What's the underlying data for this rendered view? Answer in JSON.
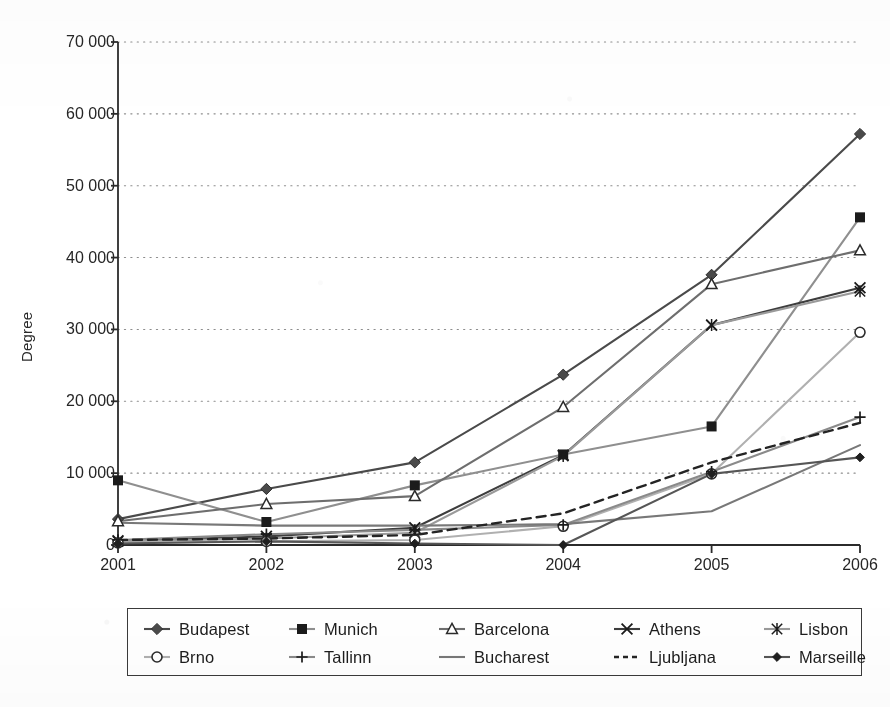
{
  "chart_data": {
    "type": "line",
    "title": "",
    "xlabel": "",
    "ylabel": "Degree",
    "categories": [
      "2001",
      "2002",
      "2003",
      "2004",
      "2005",
      "2006"
    ],
    "x": [
      2001,
      2002,
      2003,
      2004,
      2005,
      2006
    ],
    "ylim": [
      0,
      70000
    ],
    "ytick_labels": [
      "0",
      "10 000",
      "20 000",
      "30 000",
      "40 000",
      "50 000",
      "60 000",
      "70 000"
    ],
    "ytick_values": [
      0,
      10000,
      20000,
      30000,
      40000,
      50000,
      60000,
      70000
    ],
    "grid": "horizontal-dotted",
    "legend_position": "bottom",
    "legend_columns": 5,
    "series": [
      {
        "name": "Budapest",
        "marker": "diamond-filled",
        "line": "solid",
        "color": "#4a4a4a",
        "values": [
          3600,
          7800,
          11500,
          23700,
          37600,
          57200
        ]
      },
      {
        "name": "Munich",
        "marker": "square-filled",
        "line": "solid",
        "color": "#8f8f8f",
        "values": [
          9000,
          3200,
          8300,
          12600,
          16500,
          45600
        ]
      },
      {
        "name": "Barcelona",
        "marker": "triangle-open",
        "line": "solid",
        "color": "#6e6e6e",
        "values": [
          3300,
          5700,
          6800,
          19200,
          36300,
          41000
        ]
      },
      {
        "name": "Athens",
        "marker": "x-cross",
        "line": "solid",
        "color": "#3d3d3d",
        "values": [
          600,
          1200,
          2400,
          12500,
          30600,
          35800
        ]
      },
      {
        "name": "Lisbon",
        "marker": "asterisk",
        "line": "solid",
        "color": "#9a9a9a",
        "values": [
          500,
          900,
          1700,
          12400,
          30600,
          35300
        ]
      },
      {
        "name": "Brno",
        "marker": "circle-open",
        "line": "solid",
        "color": "#b0b0b0",
        "values": [
          300,
          500,
          700,
          2600,
          9900,
          29600
        ]
      },
      {
        "name": "Tallinn",
        "marker": "plus",
        "line": "solid",
        "color": "#8a8a8a",
        "values": [
          700,
          1500,
          2100,
          2800,
          10200,
          17800
        ]
      },
      {
        "name": "Bucharest",
        "marker": "none",
        "line": "solid",
        "color": "#787878",
        "values": [
          3100,
          2700,
          2700,
          2900,
          4700,
          13900
        ]
      },
      {
        "name": "Ljubljana",
        "marker": "none",
        "line": "dashed",
        "color": "#242424",
        "values": [
          700,
          900,
          1400,
          4400,
          11500,
          17000
        ]
      },
      {
        "name": "Marseille",
        "marker": "diamond-small",
        "line": "solid",
        "color": "#565656",
        "values": [
          200,
          500,
          200,
          0,
          9900,
          12200
        ]
      }
    ]
  },
  "axis": {
    "y_title": "Degree"
  },
  "legend": {
    "items": [
      {
        "label": "Budapest"
      },
      {
        "label": "Munich"
      },
      {
        "label": "Barcelona"
      },
      {
        "label": "Athens"
      },
      {
        "label": "Lisbon"
      },
      {
        "label": "Brno"
      },
      {
        "label": "Tallinn"
      },
      {
        "label": "Bucharest"
      },
      {
        "label": "Ljubljana"
      },
      {
        "label": "Marseille"
      }
    ]
  }
}
